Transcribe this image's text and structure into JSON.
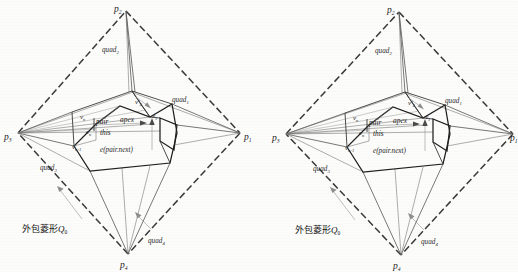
{
  "figure": {
    "caption_present": false,
    "panel_count": 2,
    "background_color": "#fcfcfb",
    "ink_color": "#222222"
  },
  "diagram": {
    "vertices": [
      {
        "key": "p1",
        "label": "p",
        "sub": "1",
        "role": "right-apex"
      },
      {
        "key": "p2",
        "label": "p",
        "sub": "2",
        "role": "top-apex"
      },
      {
        "key": "p3",
        "label": "p",
        "sub": "3",
        "role": "left-apex"
      },
      {
        "key": "p4",
        "label": "p",
        "sub": "4",
        "role": "bottom-apex"
      }
    ],
    "quads": [
      {
        "key": "quad1",
        "label": "quad",
        "sub": "1"
      },
      {
        "key": "quad2",
        "label": "quad",
        "sub": "2"
      },
      {
        "key": "quad3",
        "label": "quad",
        "sub": "3"
      },
      {
        "key": "quad4",
        "label": "quad",
        "sub": "4"
      }
    ],
    "inner_labels": [
      {
        "key": "vn",
        "label": "v",
        "sub": "n"
      },
      {
        "key": "vnm1",
        "label": "v",
        "sub": "n-1"
      },
      {
        "key": "v1",
        "label": "v",
        "sub": "1"
      },
      {
        "key": "v2p",
        "label": "v'",
        "sub": "2"
      },
      {
        "key": "en",
        "label": "e",
        "sub": "n"
      },
      {
        "key": "pair",
        "label": "pair",
        "sub": ""
      },
      {
        "key": "apex",
        "label": "apex",
        "sub": ""
      },
      {
        "key": "this",
        "label": "this",
        "sub": ""
      },
      {
        "key": "epairnext",
        "label": "e(pair.next)",
        "sub": ""
      }
    ],
    "annotation_cn": {
      "text": "外包菱形",
      "symbol": "Q",
      "symbol_sub": "0"
    }
  }
}
